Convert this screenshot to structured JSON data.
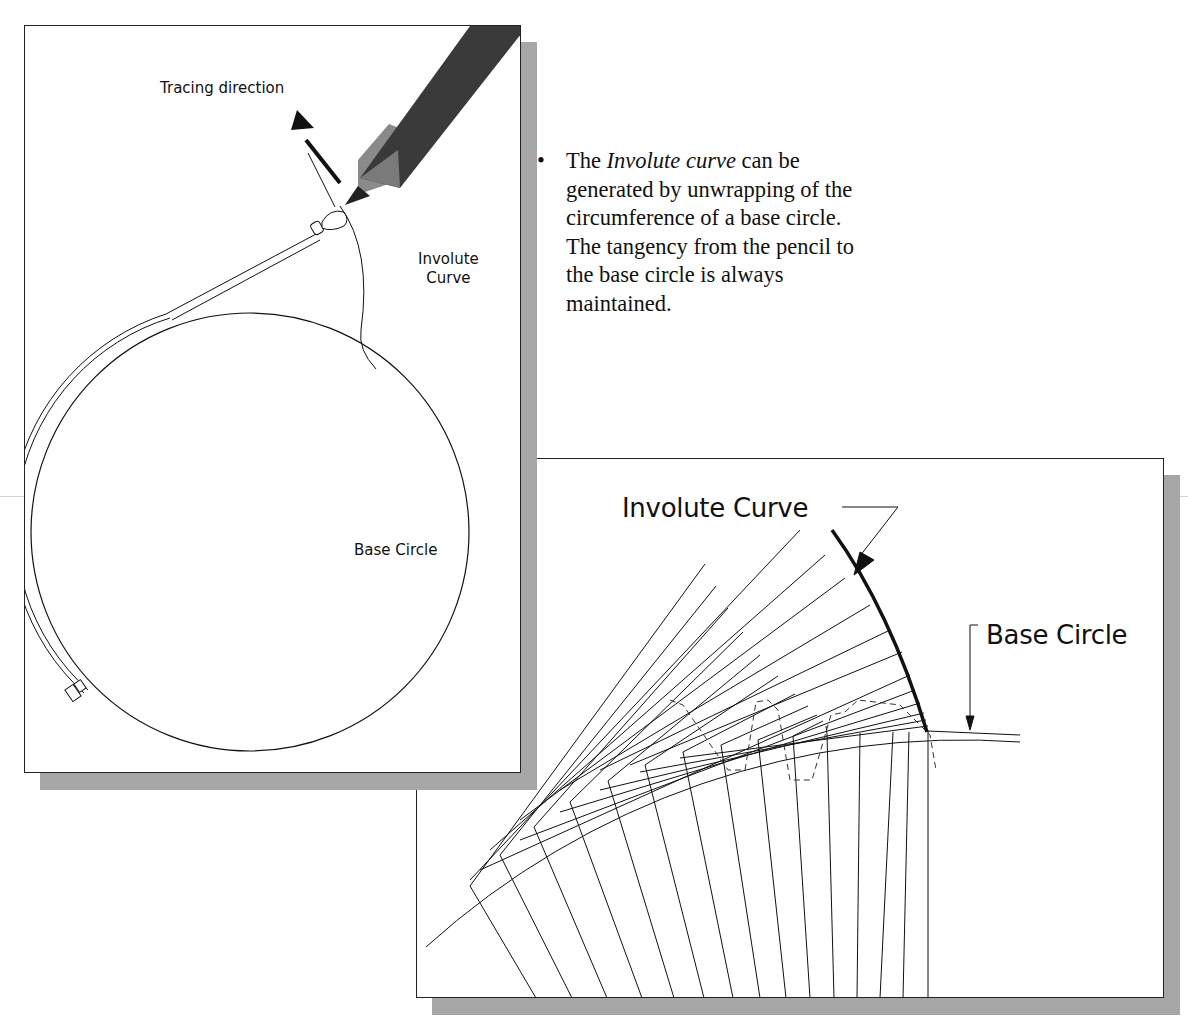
{
  "left_figure": {
    "tracing_direction_label": "Tracing direction",
    "involute_label_line1": "Involute",
    "involute_label_line2": "Curve",
    "base_circle_label": "Base Circle"
  },
  "bullet": {
    "marker": "•",
    "text_before": "The ",
    "text_italic": "Involute curve",
    "text_after": " can be generated by unwrapping of the circumference of a base circle. The tangency from the pencil to the base circle is always maintained."
  },
  "right_figure": {
    "involute_curve_label": "Involute Curve",
    "base_circle_label": "Base Circle"
  },
  "colors": {
    "line": "#111111",
    "shadow": "#a6a6a6",
    "pencil": "#3a3a3a",
    "background": "#ffffff"
  }
}
